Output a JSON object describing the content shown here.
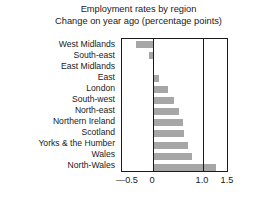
{
  "chart_data": {
    "type": "bar",
    "orientation": "horizontal",
    "title": "Employment rates by region",
    "subtitle": "Change on year ago (percentage points)",
    "xlabel": "",
    "ylabel": "",
    "xlim": [
      -0.62,
      1.52
    ],
    "xticks": [
      -0.5,
      0,
      1.0,
      1.5
    ],
    "xtick_labels": [
      "—0.5",
      "0",
      "1.0",
      "1.5"
    ],
    "gridlines": [
      0,
      1.0
    ],
    "grid": false,
    "legend": null,
    "bar_color": "#a6a6a6",
    "frame_color": "#1a1a1a",
    "categories": [
      "West Midlands",
      "South-east",
      "East Midlands",
      "East",
      "London",
      "South-west",
      "North-east",
      "Northern Ireland",
      "Scotland",
      "Yorks & the Humber",
      "Wales",
      "North-Wales"
    ],
    "values": [
      -0.35,
      -0.08,
      0.0,
      0.12,
      0.3,
      0.42,
      0.52,
      0.6,
      0.62,
      0.7,
      0.78,
      1.25
    ]
  },
  "axis": {
    "tick_minus_half": "—0.5",
    "tick_zero": "0",
    "tick_one": "1.0",
    "tick_one_half": "1.5"
  },
  "labels": {
    "r0": "West Midlands",
    "r1": "South-east",
    "r2": "East Midlands",
    "r3": "East",
    "r4": "London",
    "r5": "South-west",
    "r6": "North-east",
    "r7": "Northern Ireland",
    "r8": "Scotland",
    "r9": "Yorks & the Humber",
    "r10": "Wales",
    "r11": "North-Wales"
  }
}
